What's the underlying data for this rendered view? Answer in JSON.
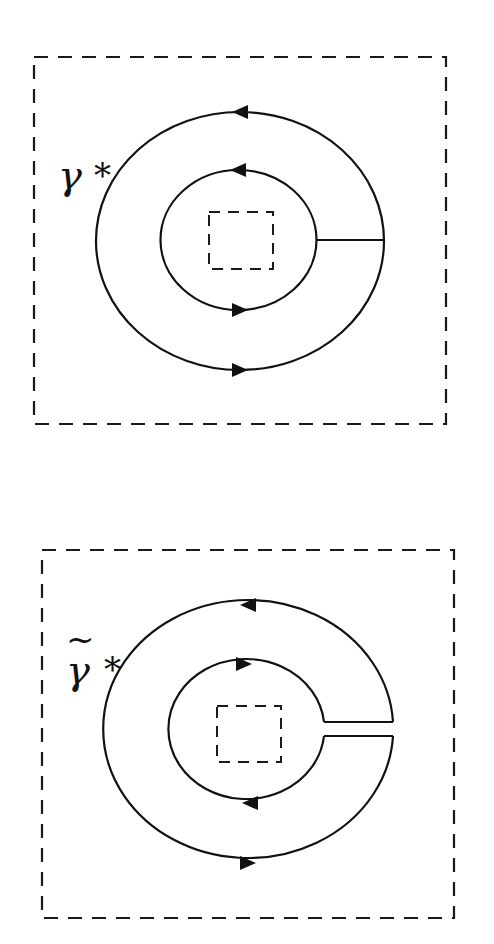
{
  "figures": [
    {
      "id": "top",
      "label": {
        "symbol": "γ",
        "superscript": "*",
        "tilde": false
      },
      "contour_type": "closed annulus with radial cut",
      "outer_arrow_top": "left",
      "outer_arrow_bottom": "right",
      "inner_arrow_top": "left",
      "inner_arrow_bottom": "right"
    },
    {
      "id": "bottom",
      "label": {
        "symbol": "γ",
        "superscript": "*",
        "tilde": true,
        "tilde_char": "~"
      },
      "contour_type": "keyhole contour with slit",
      "outer_arrow_top": "left",
      "outer_arrow_bottom": "right",
      "inner_arrow_top": "right",
      "inner_arrow_bottom": "left"
    }
  ],
  "colors": {
    "stroke": "#111111",
    "background": "#ffffff"
  }
}
